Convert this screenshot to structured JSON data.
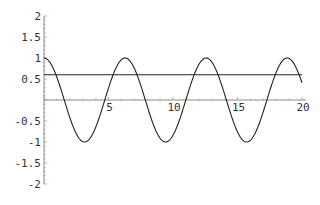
{
  "chart_data": {
    "type": "line",
    "title": "",
    "xlabel": "",
    "ylabel": "",
    "xlim": [
      0,
      20
    ],
    "ylim": [
      -2,
      2
    ],
    "grid": false,
    "legend": null,
    "x_ticks": [
      "5",
      "10",
      "15",
      "20"
    ],
    "y_ticks": [
      "2",
      "1.5",
      "1",
      "0.5",
      "-0.5",
      "-1",
      "-1.5",
      "-2"
    ],
    "series": [
      {
        "name": "cos(x)",
        "function": "cos(x)",
        "x_range": [
          0,
          20
        ],
        "color": "#222222",
        "x": [
          0,
          1.57,
          3.14,
          4.71,
          6.28,
          7.85,
          9.42,
          10.99,
          12.57,
          14.14,
          15.71,
          17.28,
          18.85,
          20
        ],
        "values": [
          1,
          0,
          -1,
          0,
          1,
          0,
          -1,
          0,
          1,
          0,
          -1,
          0,
          1,
          0.41
        ]
      },
      {
        "name": "constant",
        "function": "0.6",
        "x_range": [
          0,
          20
        ],
        "color": "#222222",
        "x": [
          0,
          20
        ],
        "values": [
          0.6,
          0.6
        ]
      }
    ]
  }
}
